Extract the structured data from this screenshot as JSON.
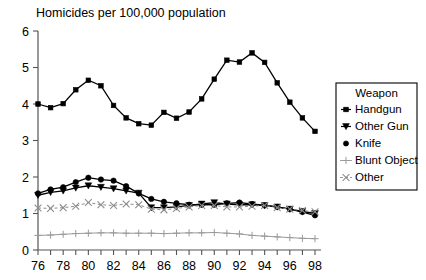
{
  "chart_data": {
    "type": "line",
    "title": "Homicides per 100,000 population",
    "xlabel": "",
    "ylabel": "",
    "ylim": [
      0,
      6
    ],
    "xlim": [
      76,
      98
    ],
    "grid": false,
    "legend_position": "right",
    "legend_title": "Weapon",
    "x": [
      76,
      77,
      78,
      79,
      80,
      81,
      82,
      83,
      84,
      85,
      86,
      87,
      88,
      89,
      90,
      91,
      92,
      93,
      94,
      95,
      96,
      97,
      98
    ],
    "xticklabels": [
      "76",
      "",
      "78",
      "",
      "80",
      "",
      "82",
      "",
      "84",
      "",
      "86",
      "",
      "88",
      "",
      "90",
      "",
      "92",
      "",
      "94",
      "",
      "96",
      "",
      "98"
    ],
    "yticks": [
      0,
      1,
      2,
      3,
      4,
      5,
      6
    ],
    "yticklabels": [
      "0",
      "1",
      "2",
      "3",
      "4",
      "5",
      "6"
    ],
    "series": [
      {
        "name": "Handgun",
        "marker": "square",
        "dash": "solid",
        "color": "#000000",
        "values": [
          4.0,
          3.9,
          4.01,
          4.39,
          4.65,
          4.5,
          3.96,
          3.62,
          3.46,
          3.42,
          3.77,
          3.61,
          3.78,
          4.14,
          4.68,
          5.2,
          5.15,
          5.4,
          5.14,
          4.58,
          4.05,
          3.62,
          3.25
        ]
      },
      {
        "name": "Other Gun",
        "marker": "triangle-down",
        "dash": "solid",
        "color": "#000000",
        "values": [
          1.5,
          1.58,
          1.62,
          1.7,
          1.76,
          1.72,
          1.68,
          1.62,
          1.56,
          1.16,
          1.16,
          1.18,
          1.22,
          1.26,
          1.3,
          1.26,
          1.24,
          1.24,
          1.22,
          1.18,
          1.12,
          1.06,
          1.0
        ]
      },
      {
        "name": "Knife",
        "marker": "circle",
        "dash": "solid",
        "color": "#000000",
        "values": [
          1.55,
          1.66,
          1.72,
          1.86,
          1.98,
          1.93,
          1.9,
          1.75,
          1.55,
          1.4,
          1.32,
          1.28,
          1.24,
          1.24,
          1.24,
          1.28,
          1.3,
          1.26,
          1.22,
          1.18,
          1.12,
          1.04,
          0.95
        ]
      },
      {
        "name": "Blunt Object",
        "marker": "plus",
        "dash": "solid",
        "color": "#9a9a9a",
        "values": [
          0.4,
          0.41,
          0.43,
          0.45,
          0.46,
          0.47,
          0.47,
          0.46,
          0.46,
          0.46,
          0.45,
          0.46,
          0.47,
          0.47,
          0.48,
          0.46,
          0.44,
          0.4,
          0.38,
          0.36,
          0.34,
          0.32,
          0.31
        ]
      },
      {
        "name": "Other",
        "marker": "x",
        "dash": "dashed",
        "color": "#8e8e8e",
        "values": [
          1.15,
          1.14,
          1.16,
          1.2,
          1.3,
          1.24,
          1.22,
          1.26,
          1.24,
          1.12,
          1.1,
          1.14,
          1.18,
          1.22,
          1.22,
          1.18,
          1.18,
          1.2,
          1.22,
          1.16,
          1.12,
          1.08,
          1.05
        ]
      }
    ]
  },
  "legend": {
    "title": "Weapon",
    "items": [
      {
        "label": "Handgun"
      },
      {
        "label": "Other Gun"
      },
      {
        "label": "Knife"
      },
      {
        "label": "Blunt Object"
      },
      {
        "label": "Other"
      }
    ]
  }
}
